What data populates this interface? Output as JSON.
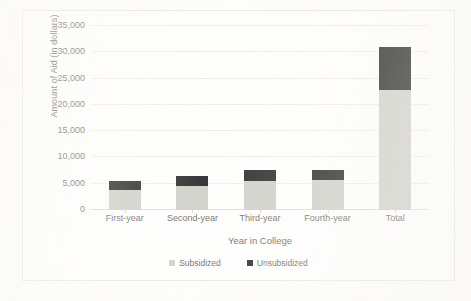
{
  "chart_data": {
    "type": "bar",
    "subtype": "stacked-bar",
    "title": "",
    "xlabel": "Year in College",
    "ylabel": "Amount of Aid (in dollars)",
    "categories": [
      "First-year",
      "Second-year",
      "Third-year",
      "Fourth-year",
      "Total"
    ],
    "series": [
      {
        "name": "Subsidized",
        "color": "#c9c9c3",
        "values": [
          3800,
          4600,
          5600,
          5800,
          22800
        ]
      },
      {
        "name": "Unsubsidized",
        "color": "#0d0d0d",
        "values": [
          1800,
          1900,
          2000,
          1800,
          8200
        ]
      }
    ],
    "totals": [
      5600,
      6500,
      7600,
      7600,
      31000
    ],
    "ylim": [
      0,
      35000
    ],
    "ytick_values": [
      0,
      5000,
      10000,
      15000,
      20000,
      25000,
      30000,
      35000
    ],
    "ytick_labels": [
      "0",
      "5,000",
      "10,000",
      "15,000",
      "20,000",
      "25,000",
      "30,000",
      "35,000"
    ],
    "grid": true,
    "legend_position": "bottom",
    "legend_entries": [
      "Subsidized",
      "Unsubsidized"
    ]
  }
}
